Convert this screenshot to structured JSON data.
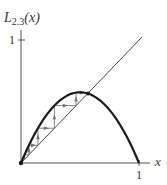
{
  "figure": {
    "y_label": "L",
    "y_label_sub": "2.3",
    "y_label_arg": "(x)",
    "x_label": "x",
    "x_tick_label": "1",
    "y_tick_label": "1"
  },
  "colors": {
    "curve": "#1a1a1a",
    "axes": "#555555",
    "diagonal": "#444444",
    "cobweb": "#777777"
  },
  "chart_data": {
    "type": "line",
    "title": "",
    "function": "L_2.3(x) = 2.3 x (1 - x)",
    "r": 2.3,
    "xlabel": "x",
    "ylabel": "L_2.3(x)",
    "xlim": [
      0,
      1
    ],
    "ylim": [
      0,
      1
    ],
    "x_ticks": [
      1
    ],
    "y_ticks": [
      1
    ],
    "grid": false,
    "series": [
      {
        "name": "L_2.3(x)",
        "x": [
          0,
          0.1,
          0.2,
          0.3,
          0.4,
          0.5,
          0.6,
          0.7,
          0.8,
          0.9,
          1.0
        ],
        "y": [
          0,
          0.207,
          0.368,
          0.483,
          0.552,
          0.575,
          0.552,
          0.483,
          0.368,
          0.207,
          0
        ]
      },
      {
        "name": "y = x",
        "x": [
          0,
          1
        ],
        "y": [
          0,
          1
        ]
      }
    ],
    "cobweb_start": 0.0,
    "fixed_point": 0.565,
    "annotations": [
      "cobweb iteration arrows converging to fixed point x* ≈ 0.565"
    ]
  }
}
